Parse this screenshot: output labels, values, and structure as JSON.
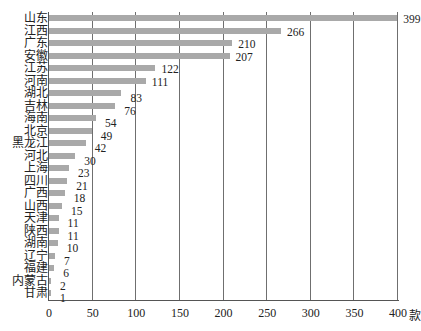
{
  "chart_data": {
    "type": "bar",
    "orientation": "horizontal",
    "title": "",
    "xlabel": "款",
    "ylabel": "",
    "xlim": [
      0,
      400
    ],
    "x_ticks": [
      "0",
      "50",
      "100",
      "150",
      "200",
      "250",
      "300",
      "350",
      "400"
    ],
    "grid": "vertical",
    "legend": "none",
    "bar_color": "#a9a9a9",
    "categories": [
      "山东",
      "江西",
      "广东",
      "安徽",
      "江苏",
      "河南",
      "湖北",
      "吉林",
      "海南",
      "北京",
      "黑龙江",
      "河北",
      "上海",
      "四川",
      "广西",
      "山西",
      "天津",
      "陕西",
      "湖南",
      "辽宁",
      "福建",
      "内蒙古",
      "甘肃"
    ],
    "values": [
      399,
      266,
      210,
      207,
      122,
      111,
      83,
      76,
      54,
      49,
      42,
      30,
      23,
      21,
      18,
      15,
      11,
      11,
      10,
      7,
      6,
      2,
      1
    ]
  }
}
